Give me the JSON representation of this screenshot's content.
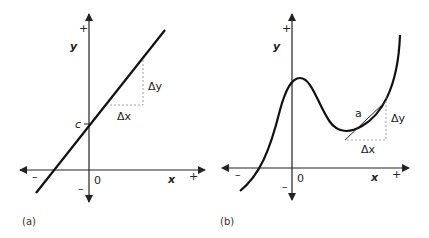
{
  "panel_a": {
    "caption": "(a)",
    "y_axis_label": "y",
    "x_axis_label": "x",
    "y_plus": "+",
    "y_minus": "–",
    "x_plus": "+",
    "x_minus": "–",
    "origin": "0",
    "intercept_label": "c",
    "delta_y": "Δy",
    "delta_x": "Δx"
  },
  "panel_b": {
    "caption": "(b)",
    "y_axis_label": "y",
    "x_axis_label": "x",
    "y_plus": "+",
    "y_minus": "–",
    "x_plus": "+",
    "x_minus": "–",
    "origin": "0",
    "point_label": "a",
    "delta_y": "Δy",
    "delta_x": "Δx"
  },
  "colors": {
    "ink": "#222222",
    "dash": "#888888"
  }
}
